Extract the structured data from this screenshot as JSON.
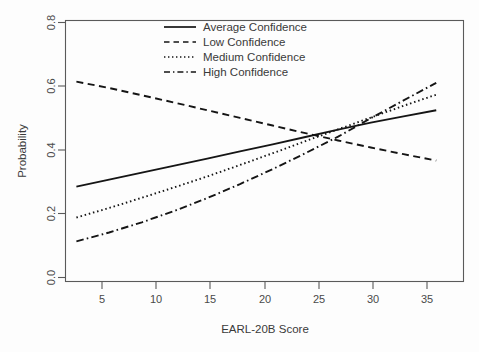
{
  "chart_data": {
    "type": "line",
    "title": "",
    "xlabel": "EARL-20B Score",
    "ylabel": "Probability",
    "xlim": [
      2.0,
      38.5
    ],
    "ylim": [
      0.0,
      0.82
    ],
    "grid": false,
    "legend_position": "top-center",
    "xticks": [
      5,
      10,
      15,
      20,
      25,
      30,
      35
    ],
    "xtick_labels": [
      "5",
      "10",
      "15",
      "20",
      "25",
      "30",
      "35"
    ],
    "yticks": [
      0.0,
      0.2,
      0.4,
      0.6,
      0.8
    ],
    "ytick_labels": [
      "0.0",
      "0.2",
      "0.4",
      "0.6",
      "0.8"
    ],
    "x": [
      3,
      6,
      9,
      12,
      15,
      18,
      21,
      24,
      27,
      30,
      33,
      36
    ],
    "series": [
      {
        "name": "Average Confidence",
        "linestyle": "solid",
        "color": "#151515",
        "values": [
          0.298,
          0.32,
          0.342,
          0.364,
          0.386,
          0.409,
          0.431,
          0.454,
          0.477,
          0.499,
          0.519,
          0.538
        ]
      },
      {
        "name": "Low Confidence",
        "linestyle": "dashed",
        "color": "#151515",
        "values": [
          0.628,
          0.608,
          0.585,
          0.562,
          0.538,
          0.514,
          0.49,
          0.466,
          0.443,
          0.421,
          0.4,
          0.38
        ]
      },
      {
        "name": "Medium Confidence",
        "linestyle": "dotted",
        "color": "#151515",
        "values": [
          0.201,
          0.231,
          0.263,
          0.296,
          0.33,
          0.366,
          0.403,
          0.441,
          0.478,
          0.515,
          0.552,
          0.587
        ]
      },
      {
        "name": "High Confidence",
        "linestyle": "dashdot",
        "color": "#151515",
        "values": [
          0.126,
          0.154,
          0.186,
          0.222,
          0.262,
          0.306,
          0.353,
          0.403,
          0.455,
          0.513,
          0.569,
          0.624
        ]
      }
    ]
  },
  "legend": {
    "entries": [
      {
        "label": "Average Confidence",
        "style": "solid"
      },
      {
        "label": "Low Confidence",
        "style": "dashed"
      },
      {
        "label": "Medium Confidence",
        "style": "dotted"
      },
      {
        "label": "High Confidence",
        "style": "dashdot"
      }
    ]
  },
  "axes": {
    "x_title": "EARL-20B Score",
    "y_title": "Probability",
    "x_labels": [
      "5",
      "10",
      "15",
      "20",
      "25",
      "30",
      "35"
    ],
    "y_labels": [
      "0.0",
      "0.2",
      "0.4",
      "0.6",
      "0.8"
    ]
  }
}
